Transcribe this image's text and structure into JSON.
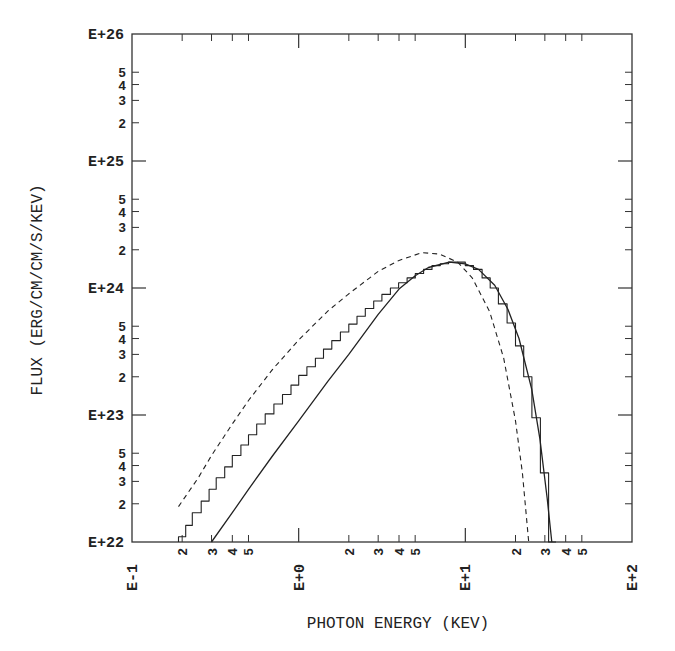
{
  "chart_data": {
    "type": "line",
    "title": "",
    "xlabel": "PHOTON ENERGY (KEV)",
    "ylabel": "FLUX (ERG/CM/CM/S/KEV)",
    "xscale": "log",
    "yscale": "log",
    "xlim": [
      0.1,
      100
    ],
    "ylim": [
      1e+22,
      1e+26
    ],
    "x_major_ticks": [
      "E-1",
      "E+0",
      "E+1",
      "E+2"
    ],
    "y_major_ticks": [
      "E+22",
      "E+23",
      "E+24",
      "E+25",
      "E+26"
    ],
    "x_minor_labels": [
      "2",
      "3",
      "4",
      "5"
    ],
    "y_minor_labels": [
      "2",
      "3",
      "4",
      "5"
    ],
    "grid": false,
    "legend": null,
    "series": [
      {
        "name": "dashed model",
        "style": "dashed",
        "x": [
          0.19,
          0.25,
          0.3,
          0.4,
          0.5,
          0.7,
          1.0,
          1.5,
          2.0,
          3.0,
          4.0,
          5.5,
          7.0,
          9.0,
          11.0,
          14.0,
          17.0,
          20.0,
          22.0,
          24.0
        ],
        "y": [
          1.9e+22,
          3.2e+22,
          4.8e+22,
          8.5e+22,
          1.3e+23,
          2.3e+23,
          3.9e+23,
          6.6e+23,
          9e+23,
          1.35e+24,
          1.65e+24,
          1.9e+24,
          1.85e+24,
          1.6e+24,
          1.2e+24,
          6.5e+23,
          2.8e+23,
          9e+22,
          3.5e+22,
          1e+22
        ]
      },
      {
        "name": "solid smooth fit",
        "style": "solid",
        "x": [
          0.3,
          0.4,
          0.5,
          0.7,
          1.0,
          1.5,
          2.0,
          3.0,
          4.0,
          5.0,
          6.0,
          8.0,
          10.0,
          12.0,
          15.0,
          18.0,
          21.0,
          25.0,
          28.0,
          31.0,
          33.0
        ],
        "y": [
          1e+22,
          1.7e+22,
          2.6e+22,
          4.8e+22,
          9e+22,
          1.85e+23,
          3e+23,
          6.2e+23,
          9.8e+23,
          1.25e+24,
          1.45e+24,
          1.6e+24,
          1.55e+24,
          1.4e+24,
          1.05e+24,
          6.8e+23,
          4e+23,
          1.6e+23,
          6.5e+22,
          2.2e+22,
          1e+22
        ]
      },
      {
        "name": "histogram data",
        "style": "step",
        "x": [
          0.19,
          0.21,
          0.23,
          0.26,
          0.29,
          0.32,
          0.36,
          0.4,
          0.45,
          0.5,
          0.56,
          0.63,
          0.71,
          0.8,
          0.9,
          1.0,
          1.12,
          1.26,
          1.41,
          1.58,
          1.78,
          2.0,
          2.24,
          2.51,
          2.82,
          3.16,
          3.55,
          3.98,
          4.47,
          5.01,
          5.62,
          6.31,
          7.08,
          7.94,
          8.91,
          10.0,
          11.2,
          12.6,
          14.1,
          15.8,
          17.8,
          20.0,
          22.4,
          25.1,
          28.2,
          31.6,
          35.0
        ],
        "y": [
          1.1e+22,
          1.35e+22,
          1.7e+22,
          2.1e+22,
          2.6e+22,
          3.2e+22,
          3.9e+22,
          4.8e+22,
          5.8e+22,
          7e+22,
          8.5e+22,
          1.02e+23,
          1.22e+23,
          1.45e+23,
          1.72e+23,
          2.05e+23,
          2.4e+23,
          2.8e+23,
          3.3e+23,
          3.85e+23,
          4.5e+23,
          5.2e+23,
          6e+23,
          6.9e+23,
          7.9e+23,
          8.9e+23,
          1e+24,
          1.1e+24,
          1.2e+24,
          1.3e+24,
          1.4e+24,
          1.5e+24,
          1.55e+24,
          1.6e+24,
          1.6e+24,
          1.5e+24,
          1.4e+24,
          1.2e+24,
          1e+24,
          7.5e+23,
          5.3e+23,
          3.5e+23,
          2e+23,
          9.5e+22,
          3.5e+22,
          1e+22,
          1e+22
        ]
      }
    ]
  },
  "axes": {
    "x_title": "PHOTON ENERGY (KEV)",
    "y_title": "FLUX (ERG/CM/CM/S/KEV)"
  }
}
